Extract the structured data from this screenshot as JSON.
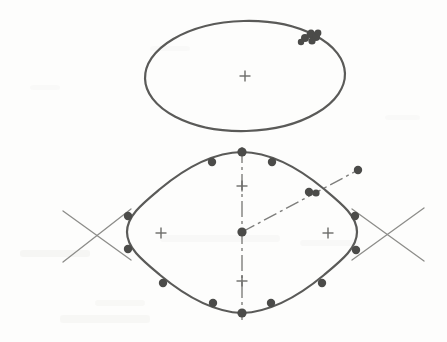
{
  "document": {
    "title": "CAD Sketch Scan",
    "kind": "scanned-technical-drawing",
    "width": 447,
    "height": 342,
    "background_color": "#fdfdfc"
  },
  "style": {
    "object_line_color": "#5a5a58",
    "object_line_width": 2.2,
    "construction_line_color": "#8d8d8a",
    "construction_line_width": 1.3,
    "centerline_color": "#7e7e7c",
    "centerline_width": 1.4,
    "node_color": "#4b4b49",
    "node_radius": 4.2,
    "cross_color": "#6b6b69",
    "cross_stroke_width": 1.4,
    "cross_arm_length": 5.5
  },
  "figures": [
    {
      "id": "top-ellipse",
      "name": "ellipse-profile",
      "type": "ellipse",
      "cx": 245,
      "cy": 76,
      "rx": 100,
      "ry": 55,
      "rotation": -1.5
    },
    {
      "id": "bottom-rounded-diamond",
      "name": "rounded-diamond-profile",
      "type": "closed-spline",
      "cx": 242,
      "cy": 232
    }
  ],
  "rounded_diamond_path": "M 242 152 C 272 152.5 300 169 324 189 C 342 204 357 216 357 232 C 357 248 342 260 324 275 C 300 295 272 312 242 313 C 212 312 184 295 160 275 C 142 260 127 248 127 232 C 127 216 142 204 160 189 C 184 169 212 152.5 242 152 Z",
  "nodes": {
    "label": "spline-control-points",
    "ellipse_cluster": [
      {
        "cx": 305,
        "cy": 38,
        "r": 4.0
      },
      {
        "cx": 311,
        "cy": 34,
        "r": 4.4
      },
      {
        "cx": 316,
        "cy": 37,
        "r": 4.0
      },
      {
        "cx": 312,
        "cy": 41,
        "r": 3.6
      },
      {
        "cx": 318,
        "cy": 33,
        "r": 3.4
      },
      {
        "cx": 301,
        "cy": 42,
        "r": 3.2
      }
    ],
    "diamond": [
      {
        "cx": 242,
        "cy": 152,
        "r": 4.6,
        "name": "node-top-vertex"
      },
      {
        "cx": 212,
        "cy": 162,
        "r": 4.2,
        "name": "node-upper-left"
      },
      {
        "cx": 272,
        "cy": 162,
        "r": 4.2,
        "name": "node-upper-right"
      },
      {
        "cx": 309,
        "cy": 192,
        "r": 4.2,
        "name": "node-upper-right-2"
      },
      {
        "cx": 316,
        "cy": 193,
        "r": 3.6,
        "name": "node-upper-right-3"
      },
      {
        "cx": 355,
        "cy": 216,
        "r": 4.2,
        "name": "node-right-upper"
      },
      {
        "cx": 356,
        "cy": 250,
        "r": 4.2,
        "name": "node-right-lower"
      },
      {
        "cx": 322,
        "cy": 283,
        "r": 4.2,
        "name": "node-lower-right"
      },
      {
        "cx": 271,
        "cy": 303,
        "r": 4.2,
        "name": "node-lower-right-2"
      },
      {
        "cx": 242,
        "cy": 313,
        "r": 4.6,
        "name": "node-bottom-vertex"
      },
      {
        "cx": 213,
        "cy": 303,
        "r": 4.2,
        "name": "node-lower-left-2"
      },
      {
        "cx": 163,
        "cy": 283,
        "r": 4.2,
        "name": "node-lower-left"
      },
      {
        "cx": 128,
        "cy": 249,
        "r": 4.2,
        "name": "node-left-lower"
      },
      {
        "cx": 128,
        "cy": 216,
        "r": 4.2,
        "name": "node-left-upper"
      },
      {
        "cx": 242,
        "cy": 232,
        "r": 4.6,
        "name": "node-center"
      }
    ],
    "free_point": {
      "cx": 358,
      "cy": 170,
      "r": 4.2,
      "name": "node-free-endpoint"
    }
  },
  "center_marks": [
    {
      "name": "center-mark-ellipse",
      "x": 245,
      "y": 76
    },
    {
      "name": "center-mark-diamond-upper",
      "x": 242,
      "y": 186
    },
    {
      "name": "center-mark-diamond-lower",
      "x": 242,
      "y": 281
    },
    {
      "name": "center-mark-diamond-left",
      "x": 161,
      "y": 233
    },
    {
      "name": "center-mark-diamond-right",
      "x": 328,
      "y": 233
    }
  ],
  "centerlines": [
    {
      "name": "vertical-centerline",
      "x1": 242,
      "y1": 147,
      "x2": 242,
      "y2": 320,
      "dash": "16 4 3 4"
    },
    {
      "name": "diagonal-centerline",
      "x1": 242,
      "y1": 232,
      "x2": 358,
      "y2": 170,
      "dash": "14 4 3 4"
    }
  ],
  "construction_crosses": [
    {
      "name": "construction-cross-left",
      "lines": [
        {
          "x1": 63,
          "y1": 211,
          "x2": 131,
          "y2": 260
        },
        {
          "x1": 63,
          "y1": 262,
          "x2": 131,
          "y2": 209
        }
      ]
    },
    {
      "name": "construction-cross-right",
      "lines": [
        {
          "x1": 352,
          "y1": 260,
          "x2": 424,
          "y2": 208
        },
        {
          "x1": 352,
          "y1": 209,
          "x2": 424,
          "y2": 261
        }
      ]
    }
  ],
  "scan_artifacts": [
    {
      "x": 20,
      "y": 250,
      "w": 70,
      "h": 7,
      "o": 0.1
    },
    {
      "x": 60,
      "y": 315,
      "w": 90,
      "h": 8,
      "o": 0.09
    },
    {
      "x": 160,
      "y": 235,
      "w": 120,
      "h": 7,
      "o": 0.07
    },
    {
      "x": 300,
      "y": 240,
      "w": 60,
      "h": 6,
      "o": 0.07
    },
    {
      "x": 150,
      "y": 46,
      "w": 40,
      "h": 5,
      "o": 0.06
    },
    {
      "x": 30,
      "y": 85,
      "w": 30,
      "h": 5,
      "o": 0.06
    },
    {
      "x": 385,
      "y": 115,
      "w": 35,
      "h": 5,
      "o": 0.06
    },
    {
      "x": 95,
      "y": 300,
      "w": 50,
      "h": 6,
      "o": 0.08
    }
  ]
}
